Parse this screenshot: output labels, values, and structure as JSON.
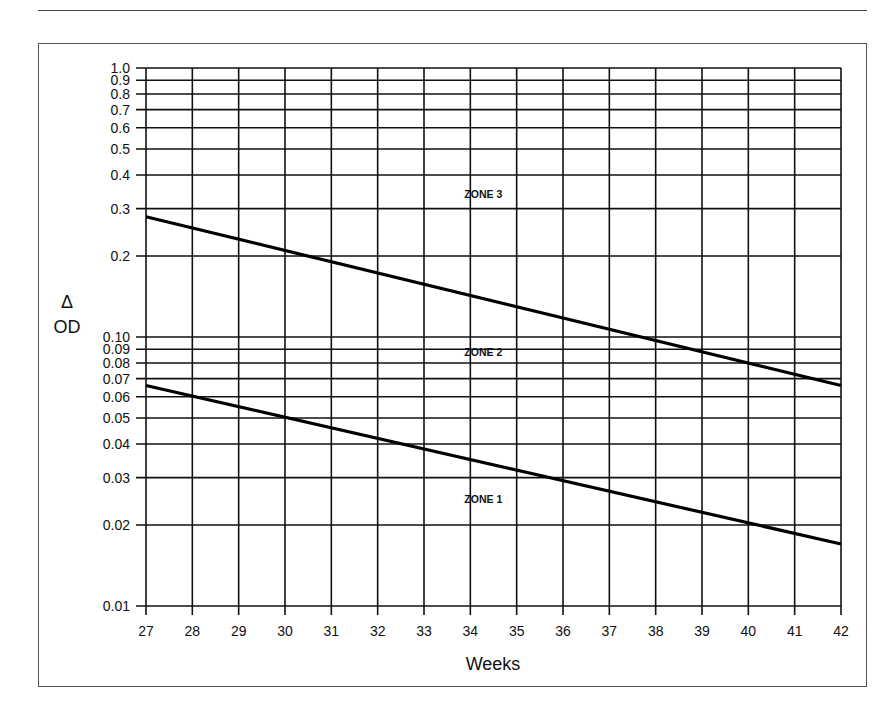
{
  "chart_data": {
    "type": "line",
    "title": "",
    "xlabel": "Weeks",
    "ylabel_symbol": "Δ",
    "ylabel": "OD",
    "yscale": "log",
    "xlim": [
      27,
      42
    ],
    "ylim": [
      0.01,
      1.0
    ],
    "grid": true,
    "x_ticks": [
      27,
      28,
      29,
      30,
      31,
      32,
      33,
      34,
      35,
      36,
      37,
      38,
      39,
      40,
      41,
      42
    ],
    "y_ticks": [
      {
        "value": 1.0,
        "label": "1.0"
      },
      {
        "value": 0.9,
        "label": "0.9"
      },
      {
        "value": 0.8,
        "label": "0.8"
      },
      {
        "value": 0.7,
        "label": "0.7"
      },
      {
        "value": 0.6,
        "label": "0.6"
      },
      {
        "value": 0.5,
        "label": "0.5"
      },
      {
        "value": 0.4,
        "label": "0.4"
      },
      {
        "value": 0.3,
        "label": "0.3"
      },
      {
        "value": 0.2,
        "label": "0.2"
      },
      {
        "value": 0.1,
        "label": "0.10"
      },
      {
        "value": 0.09,
        "label": "0.09"
      },
      {
        "value": 0.08,
        "label": "0.08"
      },
      {
        "value": 0.07,
        "label": "0.07"
      },
      {
        "value": 0.06,
        "label": "0.06"
      },
      {
        "value": 0.05,
        "label": "0.05"
      },
      {
        "value": 0.04,
        "label": "0.04"
      },
      {
        "value": 0.03,
        "label": "0.03"
      },
      {
        "value": 0.02,
        "label": "0.02"
      },
      {
        "value": 0.01,
        "label": "0.01"
      }
    ],
    "series": [
      {
        "name": "Zone 2/3 boundary",
        "x": [
          27,
          42
        ],
        "y": [
          0.28,
          0.066
        ]
      },
      {
        "name": "Zone 1/2 boundary",
        "x": [
          27,
          42
        ],
        "y": [
          0.066,
          0.017
        ]
      }
    ],
    "annotations": [
      {
        "text": "ZONE 3",
        "x": 34.0,
        "y": 0.34
      },
      {
        "text": "ZONE 2",
        "x": 34.0,
        "y": 0.088
      },
      {
        "text": "ZONE 1",
        "x": 34.0,
        "y": 0.025
      }
    ]
  }
}
